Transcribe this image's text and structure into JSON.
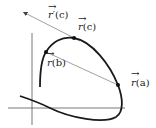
{
  "diagram": {
    "colors": {
      "curve": "#1a1a1a",
      "axes": "#444444",
      "lines": "#888888",
      "points": "#111111",
      "background": "#ffffff"
    },
    "labels": {
      "r_prime_c": {
        "vec": "r",
        "prime": "′",
        "arg": "(c)"
      },
      "r_c": {
        "vec": "r",
        "arg": "(c)"
      },
      "r_b": {
        "vec": "r",
        "arg": "(b)"
      },
      "r_a": {
        "vec": "r",
        "arg": "(a)"
      }
    },
    "points": [
      {
        "name": "r(a)",
        "x": 118,
        "y": 85
      },
      {
        "name": "r(b)",
        "x": 46,
        "y": 52
      },
      {
        "name": "r(c)",
        "x": 74,
        "y": 38
      }
    ],
    "arrow_glyph": "→"
  }
}
